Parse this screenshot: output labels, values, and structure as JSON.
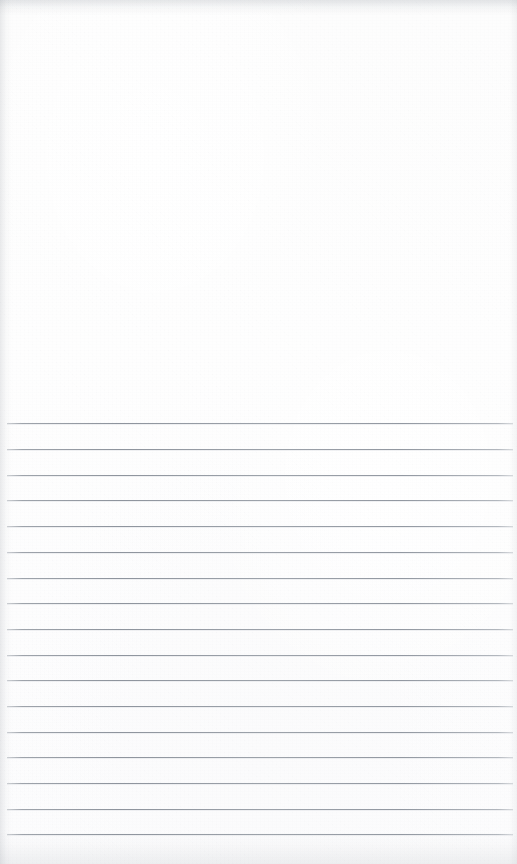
{
  "document": {
    "kind": "lined-notebook-page",
    "title": "Blank lined paper page",
    "orientation": "portrait",
    "page_width_px": 517,
    "page_height_px": 864,
    "paper_color": "#fdfdfd",
    "has_text_content": false,
    "visible_text": ""
  },
  "blank_area": {
    "name": "unruled-top-area",
    "top_px": 0,
    "height_px": 423,
    "content": ""
  },
  "ruled_area": {
    "name": "ruled-writing-area",
    "first_line_y_px": 423,
    "last_line_y_px": 834,
    "line_spacing_px": 25.7,
    "line_count": 17,
    "line_color": "#949aa2",
    "line_thickness_px": 1,
    "line_left_x_px": 7,
    "line_right_x_px": 513,
    "lines": [
      {
        "index": 1,
        "y_px": 423,
        "text": ""
      },
      {
        "index": 2,
        "y_px": 449,
        "text": ""
      },
      {
        "index": 3,
        "y_px": 475,
        "text": ""
      },
      {
        "index": 4,
        "y_px": 500,
        "text": ""
      },
      {
        "index": 5,
        "y_px": 526,
        "text": ""
      },
      {
        "index": 6,
        "y_px": 552,
        "text": ""
      },
      {
        "index": 7,
        "y_px": 578,
        "text": ""
      },
      {
        "index": 8,
        "y_px": 603,
        "text": ""
      },
      {
        "index": 9,
        "y_px": 629,
        "text": ""
      },
      {
        "index": 10,
        "y_px": 655,
        "text": ""
      },
      {
        "index": 11,
        "y_px": 680,
        "text": ""
      },
      {
        "index": 12,
        "y_px": 706,
        "text": ""
      },
      {
        "index": 13,
        "y_px": 732,
        "text": ""
      },
      {
        "index": 14,
        "y_px": 757,
        "text": ""
      },
      {
        "index": 15,
        "y_px": 783,
        "text": ""
      },
      {
        "index": 16,
        "y_px": 809,
        "text": ""
      },
      {
        "index": 17,
        "y_px": 834,
        "text": ""
      }
    ]
  },
  "edges": {
    "top_shadow_color": "#969ba2",
    "left_shadow_color": "#969ba2",
    "bottom_shadow_color": "#969ba2"
  }
}
